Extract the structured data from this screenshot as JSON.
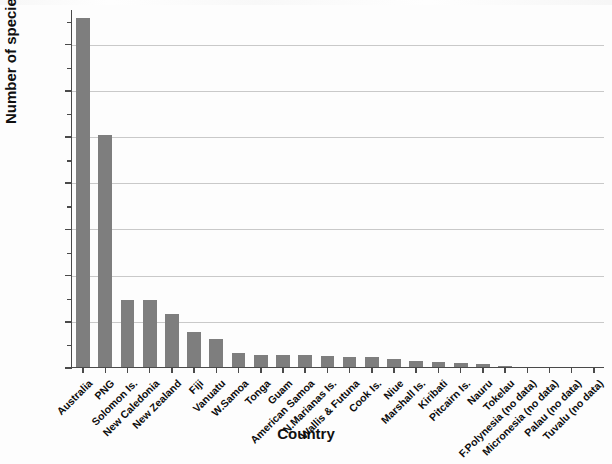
{
  "chart_data": {
    "type": "bar",
    "title": "",
    "xlabel": "Country",
    "ylabel": "Number of species",
    "ylim": [
      0,
      15500
    ],
    "yticks": [
      0,
      2000,
      4000,
      6000,
      8000,
      10000,
      12000,
      14000
    ],
    "ytick_labels": [
      "0",
      "2,000",
      "4,000",
      "6,000",
      "8,000",
      "10,000",
      "12,000",
      "14,000"
    ],
    "yminor_step": 1000,
    "grid": "horizontal",
    "legend": "none",
    "bar_color": "#7e7e7e",
    "categories": [
      "Australia",
      "PNG",
      "Solomon Is.",
      "New Caledonia",
      "New Zealand",
      "Fiji",
      "Vanuatu",
      "W.Samoa",
      "Tonga",
      "Guam",
      "American Samoa",
      "N.Marianas Is.",
      "Wallis & Futuna",
      "Cook Is.",
      "Niue",
      "Marshall Is.",
      "Kiribati",
      "Pitcairn Is.",
      "Nauru",
      "Tokelau",
      "F.Polynesia (no data)",
      "Micronesia (no data)",
      "Palau (no data)",
      "Tuvalu (no data)"
    ],
    "values": [
      15100,
      10050,
      2900,
      2880,
      2290,
      1500,
      1200,
      620,
      540,
      520,
      500,
      470,
      450,
      430,
      330,
      250,
      220,
      180,
      120,
      60,
      0,
      0,
      0,
      0
    ]
  },
  "axes": {
    "ylabel": "Number of species",
    "xlabel": "Country"
  }
}
